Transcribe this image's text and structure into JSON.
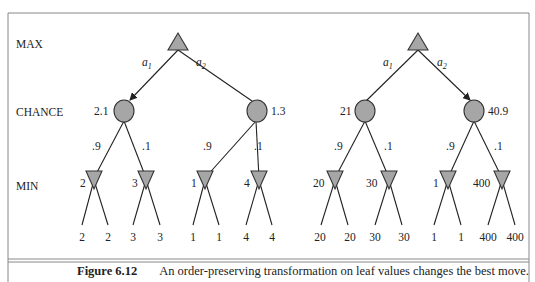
{
  "row_labels": {
    "max": "MAX",
    "chance": "CHANCE",
    "min": "MIN"
  },
  "actions": {
    "a1": "a",
    "a1_sub": "1",
    "a2": "a",
    "a2_sub": "2"
  },
  "caption": {
    "figure": "Figure 6.12",
    "text": "An order-preserving transformation on leaf values changes the best move."
  },
  "trees": [
    {
      "name": "left",
      "best_action": "a1",
      "chance_values": [
        "2.1",
        "1.3"
      ],
      "probabilities": [
        ".9",
        ".1",
        ".9",
        ".1"
      ],
      "min_values": [
        "2",
        "3",
        "1",
        "4"
      ],
      "leaves": [
        "2",
        "2",
        "3",
        "3",
        "1",
        "1",
        "4",
        "4"
      ]
    },
    {
      "name": "right",
      "best_action": "a2",
      "chance_values": [
        "21",
        "40.9"
      ],
      "probabilities": [
        ".9",
        ".1",
        ".9",
        ".1"
      ],
      "min_values": [
        "20",
        "30",
        "1",
        "400"
      ],
      "leaves": [
        "20",
        "20",
        "30",
        "30",
        "1",
        "1",
        "400",
        "400"
      ]
    }
  ],
  "colors": {
    "node_fill": "#a6a6a6",
    "line": "#222222",
    "frame": "#888888"
  }
}
